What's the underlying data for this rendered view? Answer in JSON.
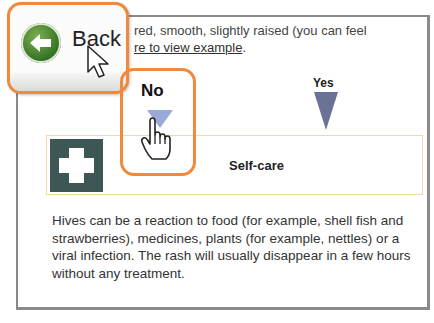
{
  "intro": {
    "text_partial": "red, smooth, slightly raised (you can feel",
    "link_partial": "re to view example",
    "link_suffix": "."
  },
  "choices": {
    "no_label": "No",
    "yes_label": "Yes"
  },
  "result": {
    "icon": "first-aid-cross-icon",
    "title": "Self-care"
  },
  "description": "Hives can be a reaction to food (for example, shell fish and strawberries), medicines, plants (for example, nettles) or a viral infection. The rash will usually disappear in a few hours without any treatment.",
  "overlay": {
    "back_label": "Back",
    "back_icon": "back-arrow-circle-icon"
  },
  "colors": {
    "highlight": "#ef8a3c",
    "no_arrow": "#9aaad6",
    "yes_arrow": "#6a7396",
    "cross_bg": "#3c5754",
    "result_border": "#f1dba0"
  }
}
